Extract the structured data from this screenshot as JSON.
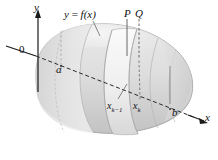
{
  "figure": {
    "background_color": "#ffffff",
    "ink_color": "#111111",
    "solid_fill_light": "#ededed",
    "solid_fill_mid": "#dcdcdc",
    "solid_fill_dark": "#c4c4c4",
    "slab_fill": "#f2f2f2",
    "outline_color": "#8c8c8c"
  },
  "axes": {
    "y_axis_label": "y",
    "x_axis_label": "x",
    "origin_label": "0",
    "x_axis_style": "dashed-through-solid"
  },
  "labels": {
    "curve": {
      "var": "y",
      "equals": " = ",
      "func": "f(x)"
    },
    "point_p": "P",
    "point_q": "Q",
    "left_bound": "a",
    "right_bound": "b",
    "slice_left": {
      "base": "x",
      "sub": "k−1"
    },
    "slice_right": {
      "base": "x",
      "sub": "k"
    }
  }
}
